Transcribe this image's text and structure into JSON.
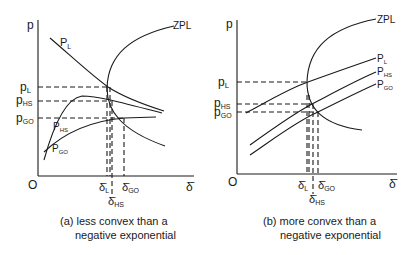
{
  "panels": [
    {
      "id": "a",
      "caption_line1": "(a) less convex than a",
      "caption_line2": "negative exponential",
      "y_axis_label": "p",
      "x_axis_label": "δ̄",
      "origin_label": "O",
      "curve_labels": {
        "zpl": "ZPL",
        "pl": "P",
        "pl_sub": "L",
        "phs": "P",
        "phs_sub": "HS",
        "pgo": "P",
        "pgo_sub": "GO"
      },
      "y_ticks": [
        {
          "main": "p",
          "sub": "L"
        },
        {
          "main": "p",
          "sub": "HS"
        },
        {
          "main": "p",
          "sub": "GO"
        }
      ],
      "x_ticks": [
        {
          "main": "δ̄",
          "sub": "L"
        },
        {
          "main": "δ̄",
          "sub": "HS"
        },
        {
          "main": "δ̄",
          "sub": "GO"
        }
      ]
    },
    {
      "id": "b",
      "caption_line1": "(b) more convex than a",
      "caption_line2": "negative exponential",
      "y_axis_label": "p",
      "x_axis_label": "δ̄",
      "origin_label": "O",
      "curve_labels": {
        "zpl": "ZPL",
        "pl": "P",
        "pl_sub": "L",
        "phs": "P",
        "phs_sub": "HS",
        "pgo": "P",
        "pgo_sub": "GO"
      },
      "y_ticks": [
        {
          "main": "p",
          "sub": "L"
        },
        {
          "main": "p",
          "sub": "HS"
        },
        {
          "main": "p",
          "sub": "GO"
        }
      ],
      "x_ticks": [
        {
          "main": "δ̄",
          "sub": "L"
        },
        {
          "main": "δ̄",
          "sub": "HS"
        },
        {
          "main": "δ̄",
          "sub": "GO"
        }
      ]
    }
  ]
}
